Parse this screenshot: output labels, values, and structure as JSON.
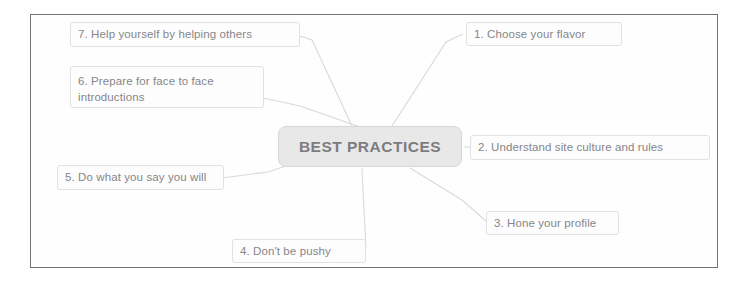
{
  "diagram": {
    "title": "BEST PRACTICES",
    "center": {
      "label": "BEST PRACTICES",
      "fill": "#e4e4e4",
      "text_color": "#636366"
    },
    "frame_color": "#59595c",
    "node_text_color": "#6e6e73",
    "node_border_color": "#dcdcdc",
    "connector_color": "#d2d2d2",
    "nodes": [
      {
        "id": 1,
        "label": "1. Choose your flavor"
      },
      {
        "id": 2,
        "label": "2. Understand site culture and rules"
      },
      {
        "id": 3,
        "label": "3. Hone your profile"
      },
      {
        "id": 4,
        "label": "4. Don't be pushy"
      },
      {
        "id": 5,
        "label": "5. Do what you say you will"
      },
      {
        "id": 6,
        "label": "6. Prepare for face to face introductions"
      },
      {
        "id": 7,
        "label": "7. Help yourself by helping others"
      }
    ]
  }
}
